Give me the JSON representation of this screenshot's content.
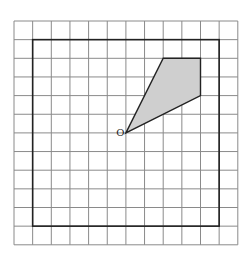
{
  "diagram": {
    "grid": {
      "cols": 12,
      "rows": 12,
      "origin_px": [
        14,
        21
      ],
      "cell_px": 18.65,
      "line_color": "#8a8a8a"
    },
    "frame": {
      "from_cell": [
        1,
        1
      ],
      "to_cell": [
        11,
        11
      ],
      "color": "#222222"
    },
    "shape": {
      "vertices_cell": [
        [
          6,
          6
        ],
        [
          8,
          2
        ],
        [
          10,
          2
        ],
        [
          10,
          4
        ]
      ],
      "fill": "#cfcfcf",
      "stroke": "#222222"
    },
    "point": {
      "label": "O",
      "cell": [
        6,
        6
      ]
    }
  }
}
